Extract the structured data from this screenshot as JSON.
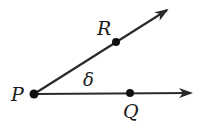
{
  "diagram": {
    "type": "angle",
    "colors": {
      "stroke": "#2a2a2a",
      "point": "#111111",
      "background": "#ffffff"
    },
    "vertex": {
      "label": "P",
      "x": 34,
      "y": 94
    },
    "rays": [
      {
        "name": "ray-PR",
        "from": "P",
        "through": "R",
        "tip": {
          "x": 167,
          "y": 10
        }
      },
      {
        "name": "ray-PQ",
        "from": "P",
        "through": "Q",
        "tip": {
          "x": 191,
          "y": 93
        }
      }
    ],
    "points": [
      {
        "label": "P",
        "x": 34,
        "y": 94,
        "label_x": 11,
        "label_y": 101
      },
      {
        "label": "R",
        "x": 116,
        "y": 42,
        "label_x": 97,
        "label_y": 35
      },
      {
        "label": "Q",
        "x": 130,
        "y": 93,
        "label_x": 123,
        "label_y": 118
      }
    ],
    "angle_label": {
      "text": "δ",
      "x": 83,
      "y": 86
    }
  }
}
